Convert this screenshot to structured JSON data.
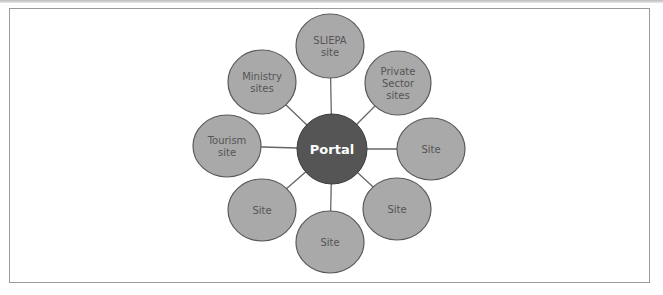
{
  "diagram": {
    "type": "hub-and-spoke",
    "hub": {
      "label": "Portal",
      "cx": 332,
      "cy": 149,
      "r": 35,
      "fill": "#555555"
    },
    "node_fill": "#a9a9a9",
    "node_stroke": "#5a5a5a",
    "line_color": "#666666",
    "nodes": [
      {
        "id": "sliepa",
        "lines": [
          "SLIEPA",
          "site"
        ],
        "cx": 330,
        "cy": 46,
        "rx": 34,
        "ry": 32
      },
      {
        "id": "private-sector",
        "lines": [
          "Private",
          "Sector",
          "sites"
        ],
        "cx": 398,
        "cy": 83,
        "rx": 33,
        "ry": 32
      },
      {
        "id": "site-east",
        "lines": [
          "Site"
        ],
        "cx": 431,
        "cy": 149,
        "rx": 34,
        "ry": 31
      },
      {
        "id": "site-southeast",
        "lines": [
          "Site"
        ],
        "cx": 397,
        "cy": 209,
        "rx": 34,
        "ry": 31
      },
      {
        "id": "site-south",
        "lines": [
          "Site"
        ],
        "cx": 330,
        "cy": 242,
        "rx": 34,
        "ry": 31
      },
      {
        "id": "site-southwest",
        "lines": [
          "Site"
        ],
        "cx": 262,
        "cy": 210,
        "rx": 34,
        "ry": 31
      },
      {
        "id": "tourism",
        "lines": [
          "Tourism",
          "site"
        ],
        "cx": 227,
        "cy": 146,
        "rx": 34,
        "ry": 31
      },
      {
        "id": "ministry",
        "lines": [
          "Ministry",
          "sites"
        ],
        "cx": 262,
        "cy": 82,
        "rx": 34,
        "ry": 32
      }
    ]
  }
}
